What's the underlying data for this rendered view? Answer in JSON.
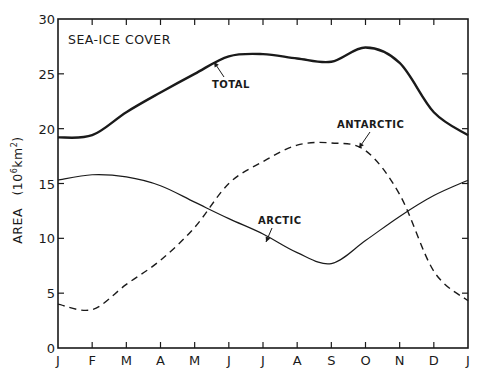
{
  "chart_data": {
    "type": "line",
    "title": "SEA-ICE COVER",
    "xlabel": "",
    "ylabel": "AREA (10^6 km^2)",
    "ylabel_parts": {
      "main": "AREA",
      "unit_open": "(10",
      "unit_exp": "6",
      "unit_mid": "km",
      "unit_exp2": "2",
      "unit_close": ")"
    },
    "categories": [
      "J",
      "F",
      "M",
      "A",
      "M",
      "J",
      "J",
      "A",
      "S",
      "O",
      "N",
      "D",
      "J"
    ],
    "yticks": [
      0,
      5,
      10,
      15,
      20,
      25,
      30
    ],
    "ylim": [
      0,
      30
    ],
    "grid": false,
    "legend": "inline labels with arrows",
    "series": [
      {
        "name": "TOTAL",
        "style": "solid-thick",
        "values": [
          19.2,
          19.4,
          21.5,
          23.3,
          25.0,
          26.6,
          26.8,
          26.4,
          26.1,
          27.4,
          26.0,
          21.5,
          19.4
        ]
      },
      {
        "name": "ARCTIC",
        "style": "solid-thin",
        "values": [
          15.3,
          15.8,
          15.6,
          14.8,
          13.3,
          11.8,
          10.4,
          8.7,
          7.7,
          9.8,
          12.0,
          13.9,
          15.3
        ]
      },
      {
        "name": "ANTARCTIC",
        "style": "dashed",
        "values": [
          4.0,
          3.5,
          5.8,
          8.0,
          11.0,
          15.0,
          17.0,
          18.5,
          18.7,
          18.0,
          14.0,
          7.0,
          4.3
        ]
      }
    ],
    "colors": {
      "line": "#1a1a1a",
      "background": "#ffffff"
    }
  }
}
